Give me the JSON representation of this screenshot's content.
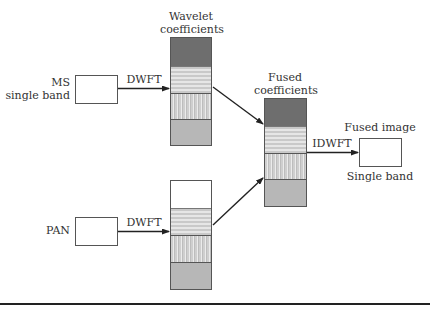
{
  "diagram": {
    "type": "wavelet image fusion flow",
    "inputs": {
      "ms": {
        "label_line1": "MS",
        "label_line2": "single band"
      },
      "pan": {
        "label": "PAN"
      }
    },
    "transforms": {
      "forward_ms": "DWFT",
      "forward_pan": "DWFT",
      "inverse": "IDWFT"
    },
    "stacks": {
      "wavelet": {
        "label_line1": "Wavelet",
        "label_line2": "coefficients"
      },
      "fused": {
        "label_line1": "Fused",
        "label_line2": "coefficients"
      }
    },
    "output": {
      "label_top": "Fused image",
      "label_bottom": "Single band"
    },
    "colors": {
      "line": "#222222",
      "approximation_band": "#6e6e6e",
      "detail_band_gray": "#b7b7b7",
      "background": "#ffffff"
    }
  }
}
